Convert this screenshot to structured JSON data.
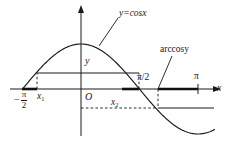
{
  "figure": {
    "background_color": "#fefefe",
    "ink_color": "#1a1a1a",
    "width": 228,
    "height": 147
  },
  "labels": {
    "curve_label": "y=cosx",
    "inverse_label": "arccosy",
    "y_value": "y",
    "origin": "O",
    "x1": "x",
    "x1_sub": "1",
    "x2": "x",
    "x2_sub": "2",
    "pi_over_two": "π/2",
    "pi": "π",
    "x_axis": "x",
    "neg_pi_over_two": {
      "minus": "−",
      "numerator": "π",
      "denominator": "2"
    }
  },
  "chart_data": {
    "type": "line",
    "xlabel": "x",
    "ylabel": "y",
    "grid": false,
    "legend": "none",
    "xlim": [
      -1.5707963,
      3.6
    ],
    "ylim": [
      -1.35,
      1.35
    ],
    "series": [
      {
        "name": "y=cosx",
        "function": "cos(x)",
        "x": [
          -1.5708,
          -1.3,
          -1.0,
          -0.7,
          -0.4,
          0.0,
          0.4,
          0.7,
          1.0,
          1.3,
          1.5708,
          1.9,
          2.2,
          2.5,
          2.8,
          3.1416,
          3.5
        ],
        "y": [
          0.0,
          0.2675,
          0.5403,
          0.7648,
          0.9211,
          1.0,
          0.9211,
          0.7648,
          0.5403,
          0.2675,
          0.0,
          -0.3233,
          -0.5885,
          -0.8011,
          -0.9422,
          -1.0,
          -0.9365
        ]
      }
    ],
    "x_tick_labels": [
      "−π/2",
      "x₁",
      "O",
      "x₂",
      "π/2",
      "π"
    ],
    "x_tick_values": [
      -1.5708,
      -1.2,
      0.0,
      1.2,
      1.5708,
      3.1416
    ],
    "annotations": [
      {
        "text": "y=cosx",
        "target": "curve near x=0.55",
        "type": "leader-line"
      },
      {
        "text": "arccosy",
        "target": "x-axis at pi/2",
        "type": "leader-line"
      },
      {
        "text": "y",
        "target": "horizontal chord level y=0.36",
        "type": "inline"
      }
    ],
    "construction_lines": [
      {
        "type": "horizontal-solid",
        "y_value": 0.36,
        "from_x": -1.2,
        "to_x": 1.2,
        "note": "chord at height y between x1 and x2"
      },
      {
        "type": "vertical-dashed",
        "x_value": -1.2,
        "from_y": 0.0,
        "to_y": 0.36
      },
      {
        "type": "vertical-dashed",
        "x_value": 1.2,
        "from_y": 0.0,
        "to_y": 0.36
      },
      {
        "type": "horizontal-dashed",
        "y_value": -0.45,
        "from_x": 0.0,
        "to_x": 2.1,
        "note": "lower level from y-axis to curve"
      },
      {
        "type": "horizontal-solid",
        "y_value": -0.45,
        "from_x": 2.1,
        "to_x": 3.6
      },
      {
        "type": "vertical-dashed",
        "x_value": 2.1,
        "from_y": -0.45,
        "to_y": 0.0
      }
    ],
    "bold_axis_segments": [
      {
        "from_x": -1.5708,
        "to_x": -1.2,
        "note": "bold segment left of x1"
      },
      {
        "from_x": 0.75,
        "to_x": 1.2,
        "note": "bold segment left of x2"
      },
      {
        "from_x": 1.5708,
        "to_x": 3.1416,
        "note": "bold segment from pi/2 to pi"
      }
    ]
  }
}
